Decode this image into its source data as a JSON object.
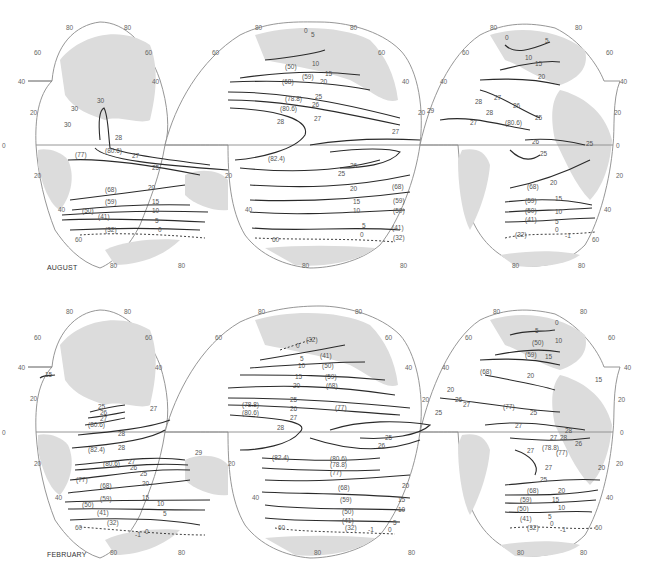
{
  "maps": [
    {
      "month": "AUGUST",
      "latitude_ticks": [
        "80",
        "60",
        "40",
        "20",
        "0",
        "20",
        "40",
        "60",
        "80"
      ],
      "isotherm_labels": {
        "indian_ocean": [
          "30",
          "30",
          "30",
          "29",
          "28",
          "28",
          "28",
          "(80.6)",
          "27",
          "(77)",
          "25",
          "(68)",
          "20",
          "(59)",
          "15",
          "(50)",
          "10",
          "(41)",
          "5",
          "(32)",
          "0",
          "-1"
        ],
        "pacific_ocean": [
          "0",
          "5",
          "(50)",
          "10",
          "(59)",
          "15",
          "(68)",
          "20",
          "(78.8)",
          "25",
          "(80.6)",
          "26",
          "28",
          "27",
          "29",
          "27",
          "(82.4)",
          "26",
          "25",
          "20",
          "(68)",
          "15",
          "(59)",
          "10",
          "(50)",
          "5",
          "(41)",
          "0",
          "-1",
          "(32)"
        ],
        "atlantic_ocean": [
          "0",
          "5",
          "10",
          "15",
          "20",
          "27",
          "28",
          "26",
          "29",
          "28",
          "27",
          "(80.6)",
          "25",
          "26",
          "25",
          "25",
          "20",
          "(68)",
          "15",
          "(59)",
          "10",
          "(50)",
          "5",
          "(41)",
          "0",
          "-1",
          "(32)"
        ]
      }
    },
    {
      "month": "FEBRUARY",
      "latitude_ticks": [
        "80",
        "60",
        "40",
        "20",
        "0",
        "20",
        "40",
        "60",
        "80"
      ],
      "isotherm_labels": {
        "indian_ocean": [
          "15",
          "25",
          "26",
          "27",
          "26",
          "27",
          "(80.6)",
          "28",
          "(82.4)",
          "28",
          "(80.6)",
          "27",
          "26",
          "25",
          "(77)",
          "29",
          "(68)",
          "20",
          "(59)",
          "15",
          "(50)",
          "10",
          "(41)",
          "5",
          "(32)",
          "0",
          "-1"
        ],
        "pacific_ocean": [
          "0",
          "(32)",
          "-1",
          "5",
          "(41)",
          "10",
          "(50)",
          "15",
          "(59)",
          "20",
          "(68)",
          "25",
          "(78.8)",
          "26",
          "(80.6)",
          "27",
          "(77)",
          "28",
          "25",
          "26",
          "(82.4)",
          "(80.6)",
          "(78.8)",
          "(77)",
          "20",
          "(68)",
          "15",
          "(59)",
          "10",
          "(50)",
          "5",
          "(41)",
          "0",
          "-1",
          "(32)"
        ],
        "atlantic_ocean": [
          "0",
          "5",
          "10",
          "(50)",
          "15",
          "(59)",
          "(68)",
          "20",
          "15",
          "20",
          "26",
          "27",
          "25",
          "(77)",
          "25",
          "27",
          "27",
          "28",
          "28",
          "26",
          "27",
          "(78.8)",
          "(77)",
          "27",
          "25",
          "20",
          "20",
          "(68)",
          "15",
          "(59)",
          "10",
          "(50)",
          "5",
          "(41)",
          "0",
          "-1",
          "(32)"
        ]
      }
    }
  ]
}
